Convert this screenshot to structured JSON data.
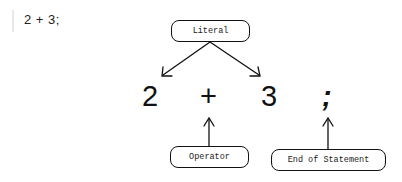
{
  "code_block": {
    "text": "2 + 3;"
  },
  "expression": {
    "tokens": [
      {
        "text": "2",
        "role": "literal"
      },
      {
        "text": "+",
        "role": "operator"
      },
      {
        "text": "3",
        "role": "literal"
      },
      {
        "text": ";",
        "role": "end-of-statement"
      }
    ]
  },
  "labels": {
    "literal": "Literal",
    "operator": "Operator",
    "end_of_statement": "End of Statement"
  }
}
